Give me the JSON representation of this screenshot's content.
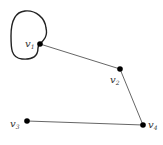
{
  "graph": {
    "colors": {
      "edge": "#555555",
      "loop": "#222222",
      "vertex": "#000000",
      "background": "#ffffff"
    },
    "vertices": [
      {
        "id": "v1",
        "base": "v",
        "sub": "1",
        "x": 40,
        "y": 44
      },
      {
        "id": "v2",
        "base": "v",
        "sub": "2",
        "x": 120,
        "y": 69
      },
      {
        "id": "v3",
        "base": "v",
        "sub": "3",
        "x": 27,
        "y": 121
      },
      {
        "id": "v4",
        "base": "v",
        "sub": "4",
        "x": 143,
        "y": 125
      }
    ],
    "edges": [
      {
        "from": "v1",
        "to": "v2"
      },
      {
        "from": "v2",
        "to": "v4"
      },
      {
        "from": "v3",
        "to": "v4"
      },
      {
        "from": "v1",
        "to": "v1",
        "type": "loop"
      }
    ],
    "labels": {
      "v1": {
        "base": "v",
        "sub": "1"
      },
      "v2": {
        "base": "v",
        "sub": "2"
      },
      "v3": {
        "base": "v",
        "sub": "3"
      },
      "v4": {
        "base": "v",
        "sub": "4"
      }
    }
  }
}
